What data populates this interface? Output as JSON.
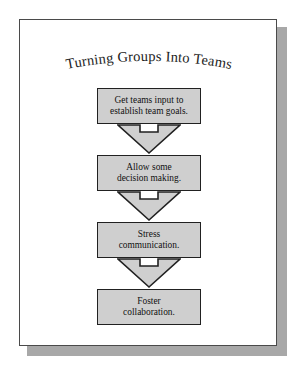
{
  "slide": {
    "title": "Turning Groups Into Teams",
    "background_color": "#ffffff",
    "border_color": "#4a4a4a",
    "shadow_color": "#a8a8a8"
  },
  "flowchart": {
    "orientation": "vertical",
    "node_fill_color": "#cfcfcf",
    "node_border_color": "#212121",
    "connector_icon": "down-arrow-icon",
    "nodes": [
      {
        "line1": "Get teams input to",
        "line2": "establish team goals.",
        "text": "Get teams input to\nestablish team goals."
      },
      {
        "line1": "Allow some",
        "line2": "decision making.",
        "text": "Allow some\ndecision making."
      },
      {
        "line1": "Stress",
        "line2": "communication.",
        "text": "Stress\ncommunication."
      },
      {
        "line1": "Foster",
        "line2": "collaboration.",
        "text": "Foster\ncollaboration."
      }
    ]
  }
}
